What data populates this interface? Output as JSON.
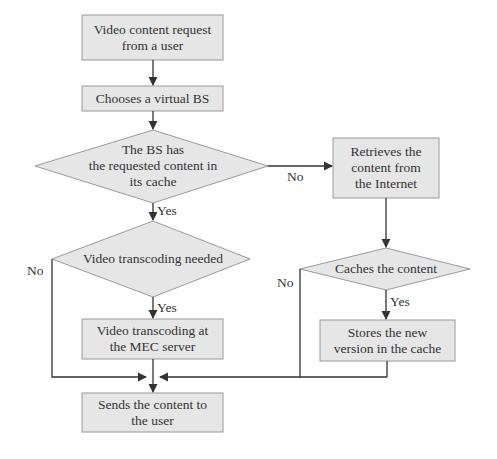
{
  "diagram": {
    "type": "flowchart",
    "colors": {
      "fill": "#e6e6e6",
      "stroke": "#9a9a9a",
      "line": "#333333",
      "text": "#333333"
    },
    "nodes": {
      "start": "Video content request\nfrom a user",
      "choose_bs": "Chooses a virtual BS",
      "has_content": "The BS has\nthe requested content in\nits cache",
      "retrieve": "Retrieves the\ncontent from\nthe Internet",
      "transcode_needed": "Video transcoding needed",
      "caches": "Caches the content",
      "transcode": "Video transcoding at\nthe MEC server",
      "store": "Stores the new\nversion in the cache",
      "send": "Sends the content to\nthe user"
    },
    "edge_labels": {
      "has_content_no": "No",
      "has_content_yes": "Yes",
      "transcode_needed_no": "No",
      "transcode_needed_yes": "Yes",
      "caches_no": "No",
      "caches_yes": "Yes"
    }
  }
}
